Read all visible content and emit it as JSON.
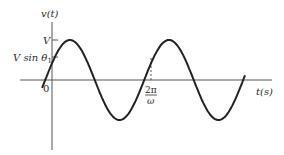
{
  "chart_data": {
    "type": "line",
    "title": "",
    "ylabel": "v(t)",
    "xlabel": "t(s)",
    "function": "v(t) = V sin(ωt + θ1)",
    "y_ticks": [
      {
        "label": "V",
        "value": 1.0
      },
      {
        "label": "V sin θ1",
        "value": 0.42
      }
    ],
    "x_ticks": [
      {
        "label": "0",
        "value": 0
      },
      {
        "label": "2π/ω",
        "value": 1,
        "dashed_marker": true
      }
    ],
    "series": [
      {
        "name": "v(t)",
        "amplitude": 1.0,
        "phase_theta1_rad": 0.43,
        "x_periods_range": [
          -0.1,
          1.95
        ],
        "color": "#222222"
      }
    ],
    "grid": false,
    "legend": null,
    "colors": {
      "curve": "#222222",
      "axis": "#555555"
    }
  },
  "labels": {
    "y_axis": "v(t)",
    "x_axis": "t(s)",
    "peak": "V",
    "initial": "V sin θ",
    "initial_sub": "1",
    "origin": "0",
    "period_num": "2π",
    "period_den": "ω"
  }
}
